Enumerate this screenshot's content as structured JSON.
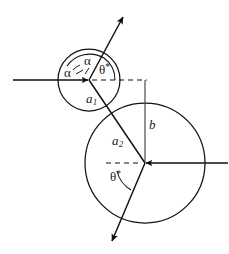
{
  "figure": {
    "stroke_color": "#111111",
    "background_color": "#ffffff",
    "labels": {
      "alpha_upper": "α",
      "alpha_left": "α",
      "theta_star_upper": "θ",
      "theta_star_upper_sup": "*",
      "theta_star_lower": "θ",
      "theta_star_lower_sup": "*",
      "a1_base": "a",
      "a1_sub": "1",
      "a2_base": "a",
      "a2_sub": "2",
      "b": "b"
    },
    "geometry": {
      "circle1": {
        "cx": 89,
        "cy": 80,
        "r": 31
      },
      "circle2": {
        "cx": 145,
        "cy": 163,
        "r": 60
      },
      "incoming_ray_left": {
        "x1": 13,
        "y1": 80,
        "x2": 89,
        "y2": 80
      },
      "incoming_ray_right": {
        "x1": 228,
        "y1": 163,
        "x2": 145,
        "y2": 163
      },
      "dashed_axis_upper": {
        "x1": 89,
        "y1": 80,
        "x2": 146,
        "y2": 80
      },
      "dashed_axis_lower": {
        "x1": 106,
        "y1": 163,
        "x2": 145,
        "y2": 163
      },
      "impact_parameter_line": {
        "x1": 145,
        "y1": 80,
        "x2": 145,
        "y2": 163
      },
      "scattered_ray_up": {
        "x1": 89,
        "y1": 80,
        "x2": 123,
        "y2": 16
      },
      "scattered_ray_down": {
        "x1": 145,
        "y1": 163,
        "x2": 112,
        "y2": 242
      }
    }
  }
}
